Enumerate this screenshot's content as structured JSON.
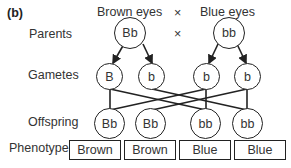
{
  "panel_label": "(b)",
  "header": {
    "left": "Brown eyes",
    "cross": "×",
    "right": "Blue eyes"
  },
  "rows": {
    "parents": "Parents",
    "gametes": "Gametes",
    "offspring": "Offspring",
    "phenotype": "Phenotype"
  },
  "parents": [
    {
      "genotype": "Bb"
    },
    {
      "genotype": "bb"
    }
  ],
  "parents_cross": "×",
  "gametes": [
    {
      "allele": "B"
    },
    {
      "allele": "b"
    },
    {
      "allele": "b"
    },
    {
      "allele": "b"
    }
  ],
  "offspring": [
    {
      "genotype": "Bb"
    },
    {
      "genotype": "Bb"
    },
    {
      "genotype": "bb"
    },
    {
      "genotype": "bb"
    }
  ],
  "phenotypes": [
    {
      "label": "Brown"
    },
    {
      "label": "Brown"
    },
    {
      "label": "Blue"
    },
    {
      "label": "Blue"
    }
  ]
}
